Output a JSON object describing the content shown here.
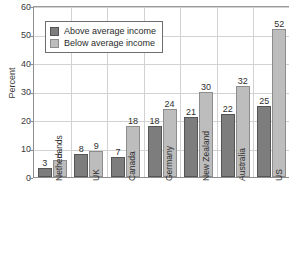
{
  "chart_data": {
    "type": "bar",
    "title": "",
    "xlabel": "",
    "ylabel": "Percent",
    "ylim": [
      0,
      60
    ],
    "ytick_values": [
      0,
      10,
      20,
      30,
      40,
      50,
      60
    ],
    "ytick_labels": [
      "0",
      "10",
      "20",
      "30",
      "40",
      "50",
      "60"
    ],
    "grid": "both",
    "legend_position": "upper-left-inside",
    "categories": [
      "Netherlands",
      "UK",
      "Canada",
      "Germany",
      "New Zealand",
      "Australia",
      "US"
    ],
    "series": [
      {
        "name": "Above average income",
        "color": "#7d7d7d",
        "values": [
          3,
          8,
          7,
          18,
          21,
          22,
          25
        ]
      },
      {
        "name": "Below average income",
        "color": "#bdbdbd",
        "values": [
          6,
          9,
          18,
          24,
          30,
          32,
          52
        ]
      }
    ],
    "data_labels": true
  },
  "legend": {
    "items": [
      {
        "label": "Above average income",
        "swatch": "above"
      },
      {
        "label": "Below average income",
        "swatch": "below"
      }
    ]
  }
}
